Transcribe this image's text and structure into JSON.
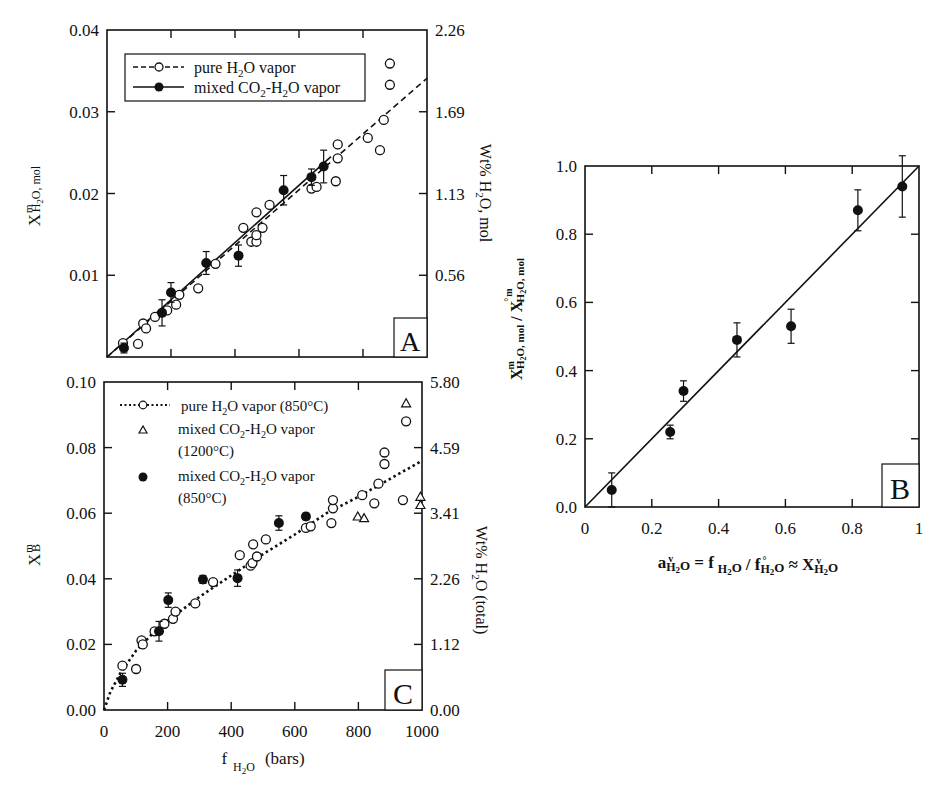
{
  "chart_data": [
    {
      "panel": "A",
      "type": "scatter",
      "xlabel": "f H2O (bars)",
      "ylabel": "X^m H2O, mol",
      "ylabel_right": "Wt% H2O, mol",
      "xlim": [
        0,
        1000
      ],
      "ylim": [
        0,
        0.04
      ],
      "xticks": [
        0,
        200,
        400,
        600,
        800,
        1000
      ],
      "yticks": [
        0.0,
        0.01,
        0.02,
        0.03,
        0.04
      ],
      "ytick_labels": [
        "",
        "0.01",
        "0.02",
        "0.03",
        "0.04"
      ],
      "yticks_right_labels": [
        "",
        "0.56",
        "1.13",
        "1.69",
        "2.26"
      ],
      "legend": [
        {
          "label": "pure H2O vapor",
          "marker": "open-circle",
          "line": "dashed"
        },
        {
          "label": "mixed CO2-H2O vapor",
          "marker": "filled-circle",
          "line": "solid"
        }
      ],
      "series": [
        {
          "name": "pure H2O vapor",
          "marker": "open-circle",
          "points": [
            [
              50,
              0.0017
            ],
            [
              97,
              0.0016
            ],
            [
              113,
              0.0041
            ],
            [
              122,
              0.0035
            ],
            [
              150,
              0.0049
            ],
            [
              188,
              0.0057
            ],
            [
              216,
              0.0064
            ],
            [
              226,
              0.0076
            ],
            [
              285,
              0.0084
            ],
            [
              339,
              0.0114
            ],
            [
              426,
              0.0158
            ],
            [
              451,
              0.0141
            ],
            [
              467,
              0.0141
            ],
            [
              467,
              0.0149
            ],
            [
              486,
              0.0158
            ],
            [
              467,
              0.0177
            ],
            [
              508,
              0.0186
            ],
            [
              639,
              0.0206
            ],
            [
              655,
              0.0208
            ],
            [
              715,
              0.0215
            ],
            [
              721,
              0.0243
            ],
            [
              721,
              0.026
            ],
            [
              815,
              0.0268
            ],
            [
              853,
              0.0253
            ],
            [
              865,
              0.029
            ],
            [
              884,
              0.0333
            ],
            [
              884,
              0.0359
            ]
          ]
        },
        {
          "name": "mixed CO2-H2O vapor",
          "marker": "filled-circle",
          "points": [
            [
              53,
              0.0011,
              0.0006
            ],
            [
              172,
              0.0054,
              0.0016
            ],
            [
              200,
              0.0079,
              0.0012
            ],
            [
              310,
              0.0115,
              0.0014
            ],
            [
              411,
              0.0124,
              0.0013
            ],
            [
              552,
              0.0204,
              0.0018
            ],
            [
              639,
              0.022,
              0.001
            ],
            [
              677,
              0.0233,
              0.002
            ]
          ]
        }
      ],
      "fit_lines": [
        {
          "name": "pure H2O vapor fit",
          "style": "dashed",
          "from": [
            0,
            0
          ],
          "to": [
            1000,
            0.0341
          ]
        },
        {
          "name": "mixed CO2-H2O vapor fit",
          "style": "solid",
          "from": [
            0,
            0
          ],
          "to": [
            700,
            0.0245
          ]
        }
      ]
    },
    {
      "panel": "B",
      "type": "scatter",
      "xlabel": "a v H2O = f H2O / f° H2O ≈ X v H2O",
      "ylabel": "X^m H2O, mol / X°^m H2O, mol",
      "xlim": [
        0,
        1
      ],
      "ylim": [
        0,
        1.0
      ],
      "xticks": [
        0,
        0.2,
        0.4,
        0.6,
        0.8,
        1
      ],
      "xtick_labels": [
        "0",
        "0.2",
        "0.4",
        "0.6",
        "0.8",
        "1"
      ],
      "yticks": [
        0,
        0.2,
        0.4,
        0.6,
        0.8,
        1.0
      ],
      "ytick_labels": [
        "0.0",
        "0.2",
        "0.4",
        "0.6",
        "0.8",
        "1.0"
      ],
      "series": [
        {
          "name": "mixed CO2-H2O vapor",
          "marker": "filled-circle",
          "points": [
            [
              0.08,
              0.05,
              0.05
            ],
            [
              0.255,
              0.22,
              0.02
            ],
            [
              0.295,
              0.34,
              0.03
            ],
            [
              0.455,
              0.49,
              0.05
            ],
            [
              0.617,
              0.53,
              0.05
            ],
            [
              0.817,
              0.87,
              0.06
            ],
            [
              0.95,
              0.94,
              0.09
            ]
          ]
        }
      ],
      "fit_lines": [
        {
          "name": "1:1 line",
          "style": "solid",
          "from": [
            0,
            0
          ],
          "to": [
            1,
            1
          ]
        }
      ]
    },
    {
      "panel": "C",
      "type": "scatter",
      "xlabel": "f H2O (bars)",
      "ylabel": "X^m B",
      "ylabel_right": "Wt% H2O (total)",
      "xlim": [
        0,
        1000
      ],
      "ylim": [
        0,
        0.1
      ],
      "xticks": [
        0,
        200,
        400,
        600,
        800,
        1000
      ],
      "xtick_labels": [
        "0",
        "200",
        "400",
        "600",
        "800",
        "1000"
      ],
      "yticks": [
        0.0,
        0.02,
        0.04,
        0.06,
        0.08,
        0.1
      ],
      "ytick_labels": [
        "0.00",
        "0.02",
        "0.04",
        "0.06",
        "0.08",
        "0.10"
      ],
      "yticks_right_labels": [
        "0.00",
        "1.12",
        "2.26",
        "3.41",
        "4.59",
        "5.80"
      ],
      "legend": [
        {
          "label": "pure H2O vapor (850°C)",
          "marker": "open-circle",
          "line": "dotted"
        },
        {
          "label": "mixed CO2-H2O vapor (1200°C)",
          "marker": "open-triangle",
          "line": "none"
        },
        {
          "label": "mixed CO2-H2O vapor (850°C)",
          "marker": "filled-circle",
          "line": "none"
        }
      ],
      "series": [
        {
          "name": "pure H2O vapor (850°C)",
          "marker": "open-circle",
          "points": [
            [
              58,
              0.0135
            ],
            [
              101,
              0.0125
            ],
            [
              118,
              0.0212
            ],
            [
              122,
              0.02
            ],
            [
              159,
              0.024
            ],
            [
              190,
              0.0263
            ],
            [
              217,
              0.0278
            ],
            [
              225,
              0.03
            ],
            [
              287,
              0.0325
            ],
            [
              343,
              0.039
            ],
            [
              427,
              0.0472
            ],
            [
              461,
              0.044
            ],
            [
              467,
              0.0448
            ],
            [
              469,
              0.0505
            ],
            [
              481,
              0.0468
            ],
            [
              509,
              0.052
            ],
            [
              635,
              0.0555
            ],
            [
              650,
              0.056
            ],
            [
              715,
              0.057
            ],
            [
              720,
              0.0615
            ],
            [
              720,
              0.064
            ],
            [
              812,
              0.0655
            ],
            [
              850,
              0.063
            ],
            [
              863,
              0.069
            ],
            [
              882,
              0.075
            ],
            [
              882,
              0.0785
            ],
            [
              940,
              0.064
            ],
            [
              950,
              0.088
            ]
          ]
        },
        {
          "name": "mixed CO2-H2O vapor (1200°C)",
          "marker": "open-triangle",
          "points": [
            [
              798,
              0.059
            ],
            [
              818,
              0.0585
            ],
            [
              950,
              0.0935
            ],
            [
              995,
              0.065
            ],
            [
              995,
              0.0625
            ]
          ]
        },
        {
          "name": "mixed CO2-H2O vapor (850°C)",
          "marker": "filled-circle",
          "points": [
            [
              58,
              0.0092,
              0.002
            ],
            [
              173,
              0.024,
              0.003
            ],
            [
              202,
              0.0335,
              0.0022
            ],
            [
              311,
              0.0398,
              0.0012
            ],
            [
              420,
              0.0402,
              0.0025
            ],
            [
              550,
              0.057,
              0.0022
            ],
            [
              635,
              0.059,
              0.001
            ]
          ]
        }
      ],
      "fit_lines": [
        {
          "name": "pure H2O vapor fit (850°C)",
          "style": "dotted",
          "shape": "curve",
          "points": [
            [
              0,
              0
            ],
            [
              20,
              0.0055
            ],
            [
              50,
              0.011
            ],
            [
              100,
              0.018
            ],
            [
              150,
              0.023
            ],
            [
              200,
              0.0272
            ],
            [
              300,
              0.0345
            ],
            [
              400,
              0.041
            ],
            [
              500,
              0.0475
            ],
            [
              600,
              0.0535
            ],
            [
              700,
              0.06
            ],
            [
              800,
              0.065
            ],
            [
              900,
              0.0705
            ],
            [
              1000,
              0.076
            ]
          ]
        }
      ]
    }
  ],
  "panels": {
    "A": {
      "label": "A"
    },
    "B": {
      "label": "B"
    },
    "C": {
      "label": "C"
    }
  },
  "axis_text": {
    "a_ylabel_main": "X",
    "a_ylabel_sup": "m",
    "a_ylabel_sub": "H",
    "a_ylabel_sub2": "2",
    "a_ylabel_sub3": "O, mol",
    "a_right_label": "Wt% H",
    "a_right_label_sub": "2",
    "a_right_label_rest": "O, mol",
    "c_ylabel_main": "X",
    "c_ylabel_sup": "m",
    "c_ylabel_sub": "B",
    "c_right_label": "Wt% H",
    "c_right_label_sub": "2",
    "c_right_label_rest": "O (total)",
    "c_xlabel_f": "f",
    "c_xlabel_sub": "H",
    "c_xlabel_sub2": "2",
    "c_xlabel_sub3": "O",
    "c_xlabel_units": "(bars)",
    "b_xlabel": "a H₂O = f H₂O / f° H₂O ≈ X H₂O",
    "b_ylabel": "X H₂O, mol / X° H₂O, mol"
  },
  "legend_a": {
    "pure_pre": "pure H",
    "pure_sub": "2",
    "pure_post": "O vapor",
    "mixed_pre": "mixed CO",
    "mixed_sub": "2",
    "mixed_mid": "-H",
    "mixed_sub2": "2",
    "mixed_post": "O vapor"
  },
  "legend_c": {
    "pure_pre": "pure H",
    "pure_sub": "2",
    "pure_post": "O vapor (850°C)",
    "m1_pre": "mixed CO",
    "m1_sub": "2",
    "m1_mid": "-H",
    "m1_sub2": "2",
    "m1_post": "O vapor",
    "m1_temp": "(1200°C)",
    "m2_pre": "mixed CO",
    "m2_sub": "2",
    "m2_mid": "-H",
    "m2_sub2": "2",
    "m2_post": "O vapor",
    "m2_temp": "(850°C)"
  }
}
